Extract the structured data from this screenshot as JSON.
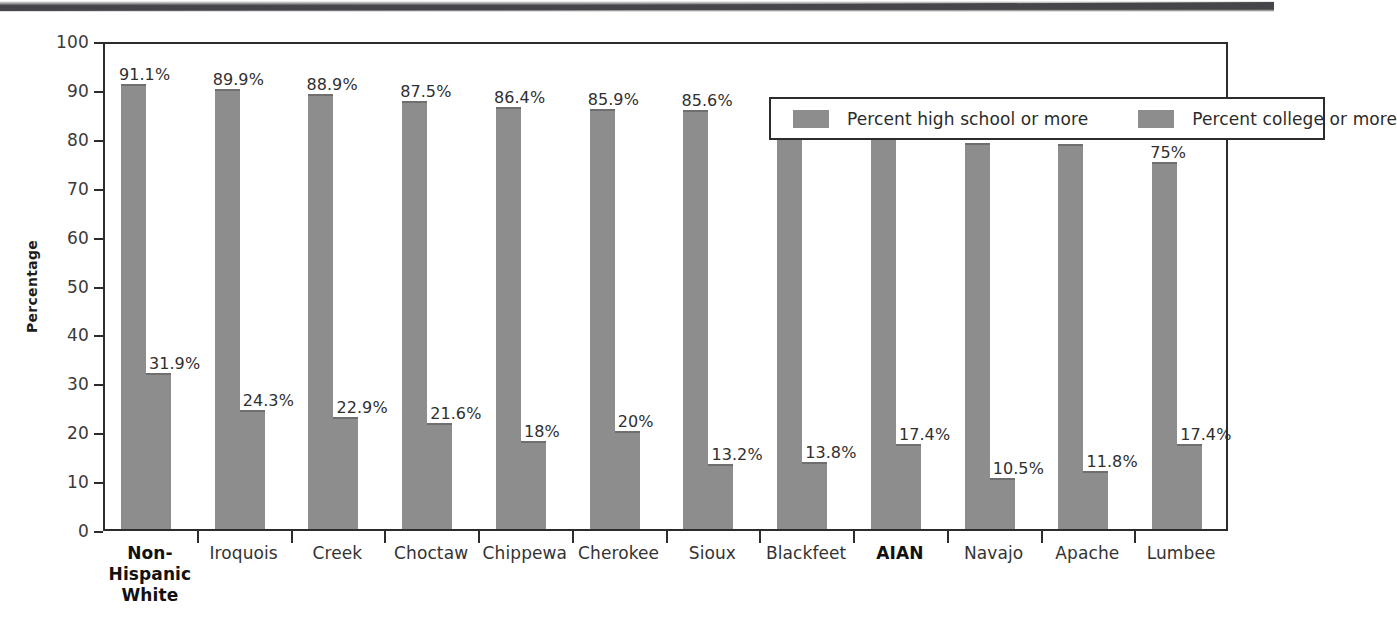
{
  "chart_data": {
    "type": "bar",
    "title": "",
    "xlabel": "",
    "ylabel": "Percentage",
    "ylim": [
      0,
      100
    ],
    "ytick_step": 10,
    "yticks": [
      "100",
      "90",
      "80",
      "70",
      "60",
      "50",
      "40",
      "30",
      "20",
      "10",
      "0"
    ],
    "grid": false,
    "legend_position": "top-right",
    "bar_color": "#8d8d8d",
    "frame_color": "#2c2c2c",
    "categories": [
      "Non-Hispanic\nWhite",
      "Iroquois",
      "Creek",
      "Choctaw",
      "Chippewa",
      "Cherokee",
      "Sioux",
      "Blackfeet",
      "AIAN",
      "Navajo",
      "Apache",
      "Lumbee"
    ],
    "category_items": [
      {
        "lines": [
          "Non-Hispanic",
          "White"
        ],
        "bold": true
      },
      {
        "lines": [
          "Iroquois"
        ],
        "bold": false
      },
      {
        "lines": [
          "Creek"
        ],
        "bold": false
      },
      {
        "lines": [
          "Choctaw"
        ],
        "bold": false
      },
      {
        "lines": [
          "Chippewa"
        ],
        "bold": false
      },
      {
        "lines": [
          "Cherokee"
        ],
        "bold": false
      },
      {
        "lines": [
          "Sioux"
        ],
        "bold": false
      },
      {
        "lines": [
          "Blackfeet"
        ],
        "bold": false
      },
      {
        "lines": [
          "AIAN"
        ],
        "bold": true
      },
      {
        "lines": [
          "Navajo"
        ],
        "bold": false
      },
      {
        "lines": [
          "Apache"
        ],
        "bold": false
      },
      {
        "lines": [
          "Lumbee"
        ],
        "bold": false
      }
    ],
    "series": [
      {
        "name": "Percent high school or more",
        "values": [
          91.1,
          89.9,
          88.9,
          87.5,
          86.4,
          85.9,
          85.6,
          84.5,
          82,
          79,
          78.8,
          75
        ],
        "labels": [
          "91.1%",
          "89.9%",
          "88.9%",
          "87.5%",
          "86.4%",
          "85.9%",
          "85.6%",
          "84.5%",
          "82%",
          "79%",
          "78.8%",
          "75%"
        ]
      },
      {
        "name": "Percent college or more",
        "values": [
          31.9,
          24.3,
          22.9,
          21.6,
          18,
          20,
          13.2,
          13.8,
          17.4,
          10.5,
          11.8,
          17.4
        ],
        "labels": [
          "31.9%",
          "24.3%",
          "22.9%",
          "21.6%",
          "18%",
          "20%",
          "13.2%",
          "13.8%",
          "17.4%",
          "10.5%",
          "11.8%",
          "17.4%"
        ]
      }
    ]
  },
  "legend": {
    "items": [
      {
        "label": "Percent high school or more",
        "color": "#8d8d8d"
      },
      {
        "label": "Percent college or more",
        "color": "#8d8d8d"
      }
    ]
  }
}
